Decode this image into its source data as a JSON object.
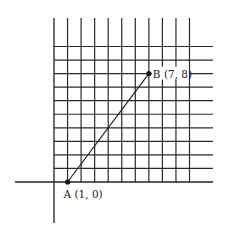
{
  "diagram": {
    "type": "coordinate-grid",
    "grid": {
      "x_lines": 10,
      "y_lines": 10,
      "cell_size_px": 13.55,
      "line_color": "#2a2a2a"
    },
    "points": [
      {
        "name": "A",
        "x": 1,
        "y": 0,
        "label": "A (1, 0)"
      },
      {
        "name": "B",
        "x": 7,
        "y": 8,
        "label": "B (7, 8)"
      }
    ],
    "segment": {
      "from": "A",
      "to": "B"
    }
  }
}
